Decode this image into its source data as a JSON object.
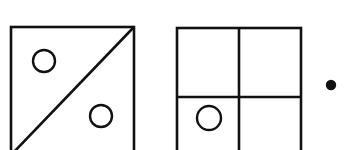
{
  "canvas": {
    "width": 344,
    "height": 150,
    "background_color": "#ffffff",
    "ink_color": "#111111",
    "description": "Line-art visual pattern puzzle: two outlined squares with internal divisions and small open circles, plus a small solid dot at right"
  },
  "figures": [
    {
      "id": "figure-1",
      "name": "square-with-diagonal",
      "square": {
        "x": 11,
        "y": 27,
        "width": 123,
        "height": 128,
        "stroke_width": 2.6,
        "clipped_bottom": true
      },
      "dividers": [
        {
          "id": "diagonal-line",
          "type": "diagonal",
          "x1": 12,
          "y1": 154,
          "x2": 133,
          "y2": 28,
          "stroke_width": 2.6
        }
      ],
      "circles": [
        {
          "id": "circle-upper-left",
          "region": "upper-left-triangle",
          "cx": 44,
          "cy": 61,
          "r": 11,
          "stroke_width": 2.4,
          "fill": "none"
        },
        {
          "id": "circle-lower-right",
          "region": "lower-right-triangle",
          "cx": 101,
          "cy": 116,
          "r": 11,
          "stroke_width": 2.4,
          "fill": "none"
        }
      ],
      "circle_count": 2
    },
    {
      "id": "figure-2",
      "name": "square-with-quadrants",
      "square": {
        "x": 177,
        "y": 28,
        "width": 124,
        "height": 127,
        "stroke_width": 2.6,
        "clipped_bottom": true
      },
      "dividers": [
        {
          "id": "vertical-divider",
          "type": "vertical",
          "x1": 239,
          "y1": 28,
          "x2": 239,
          "y2": 155,
          "stroke_width": 2.6
        },
        {
          "id": "horizontal-divider",
          "type": "horizontal",
          "x1": 177,
          "y1": 97,
          "x2": 301,
          "y2": 97,
          "stroke_width": 2.6
        }
      ],
      "circles": [
        {
          "id": "circle-bottom-left-quadrant",
          "region": "bottom-left-quadrant",
          "cx": 209,
          "cy": 118,
          "r": 12,
          "stroke_width": 2.4,
          "fill": "none"
        }
      ],
      "circle_count": 1
    }
  ],
  "markers": [
    {
      "id": "marker-dot",
      "name": "solid-dot",
      "cx": 331,
      "cy": 85,
      "r": 5.2,
      "fill": "#111111"
    }
  ]
}
